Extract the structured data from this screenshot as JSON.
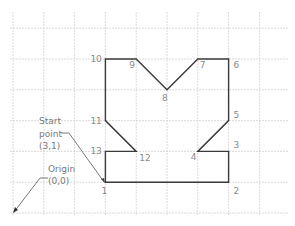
{
  "diagram": {
    "title": "",
    "grid": {
      "origin_px": [
        13,
        213
      ],
      "spacing_px": 30.8,
      "x_lines": [
        0,
        1,
        2,
        3,
        4,
        5,
        6,
        7,
        8
      ],
      "y_lines": [
        0,
        1,
        2,
        3,
        4,
        5,
        6
      ],
      "right_edge_px": 288,
      "top_edge_px": 12,
      "color": "#d0d0d0"
    },
    "shape": {
      "color": "#3a3a3a",
      "points": [
        {
          "label": "1",
          "x": 3,
          "y": 1,
          "lx": -4,
          "ly": 12
        },
        {
          "label": "2",
          "x": 7,
          "y": 1,
          "lx": 5,
          "ly": 12
        },
        {
          "label": "3",
          "x": 7,
          "y": 2,
          "lx": 5,
          "ly": -3
        },
        {
          "label": "4",
          "x": 6,
          "y": 2,
          "lx": -7,
          "ly": 9
        },
        {
          "label": "5",
          "x": 7,
          "y": 3,
          "lx": 5,
          "ly": -3
        },
        {
          "label": "6",
          "x": 7,
          "y": 5,
          "lx": 5,
          "ly": 9
        },
        {
          "label": "7",
          "x": 6,
          "y": 5,
          "lx": 2,
          "ly": 9
        },
        {
          "label": "8",
          "x": 5,
          "y": 4,
          "lx": -5,
          "ly": 11
        },
        {
          "label": "9",
          "x": 4,
          "y": 5,
          "lx": -7,
          "ly": 9
        },
        {
          "label": "10",
          "x": 3,
          "y": 5,
          "lx": -15,
          "ly": 3
        },
        {
          "label": "11",
          "x": 3,
          "y": 3,
          "lx": -15,
          "ly": 3
        },
        {
          "label": "12",
          "x": 4,
          "y": 2,
          "lx": 3,
          "ly": 10
        },
        {
          "label": "13",
          "x": 3,
          "y": 2,
          "lx": -15,
          "ly": 3
        }
      ]
    },
    "annotations": {
      "start_point": {
        "lines": [
          "Start",
          "point",
          "(3,1)"
        ],
        "text_x": 39,
        "text_y": [
          124,
          137,
          149
        ],
        "leader": [
          [
            61,
            133
          ],
          [
            69,
            133
          ],
          [
            104,
            182
          ]
        ]
      },
      "origin": {
        "lines": [
          "Origin",
          "(0,0)"
        ],
        "text_x": 48,
        "text_y": [
          172,
          184
        ],
        "leader": [
          [
            48,
            178
          ],
          [
            40,
            178
          ],
          [
            14,
            212
          ]
        ],
        "arrow_tip": [
          13,
          213
        ]
      }
    }
  }
}
